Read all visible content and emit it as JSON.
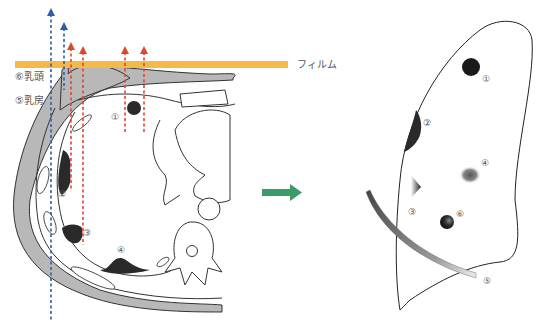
{
  "diagram": {
    "left_panel": {
      "description": "Axial cross-section of chest with X-ray beams passing to film",
      "film_label": "フィルム",
      "nipple_label": "⑥乳頭",
      "breast_label": "⑤乳房",
      "markers": [
        "①",
        "②",
        "③",
        "④"
      ]
    },
    "arrow": {
      "color": "#3d9a6a",
      "direction": "right"
    },
    "right_panel": {
      "description": "Frontal lung projection showing lesion appearances",
      "markers": [
        "①",
        "②",
        "③",
        "④",
        "⑤",
        "⑥"
      ]
    },
    "colors": {
      "film": "#f5b84a",
      "beam_red": "#e0452e",
      "beam_blue": "#2c5fa8",
      "soft_tissue": "#b8b8b8",
      "lesion": "#2a2a2a"
    }
  }
}
